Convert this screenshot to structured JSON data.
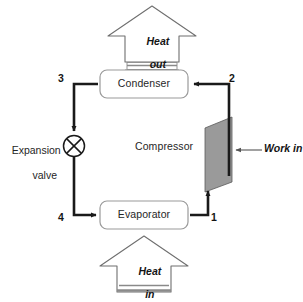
{
  "diagram": {
    "components": {
      "condenser": {
        "label": "Condenser"
      },
      "evaporator": {
        "label": "Evaporator"
      },
      "compressor": {
        "label": "Compressor"
      },
      "expansion_valve": {
        "label_line1": "Expansion",
        "label_line2": "valve"
      }
    },
    "flows": {
      "heat_out": {
        "line1": "Heat",
        "line2": "out"
      },
      "heat_in": {
        "line1": "Heat",
        "line2": "in"
      },
      "work_in": {
        "label": "Work in"
      }
    },
    "state_points": [
      {
        "id": "1",
        "label": "1"
      },
      {
        "id": "2",
        "label": "2"
      },
      {
        "id": "3",
        "label": "3"
      },
      {
        "id": "4",
        "label": "4"
      }
    ],
    "colors": {
      "background": "#ffffff",
      "line": "#1a1a1a",
      "box_border": "#8c8c8c",
      "compressor_fill": "#9a9a9a",
      "compressor_stroke": "#5a5a5a",
      "hollow_arrow_stroke": "#6f6f6f",
      "hatch": "#8a8a8a",
      "work_arrow": "#555555"
    }
  }
}
